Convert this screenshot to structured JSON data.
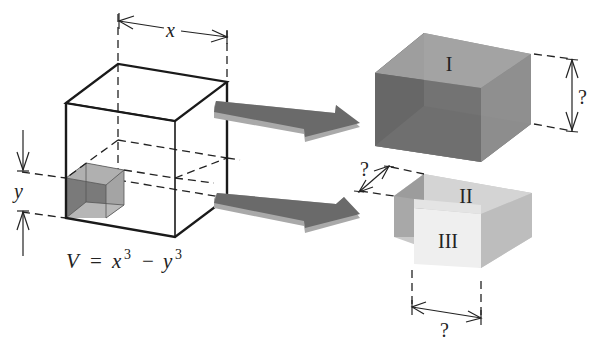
{
  "figure": {
    "left_cube": {
      "dimension_x_label": "x",
      "dimension_y_label": "y",
      "equation": {
        "V": "V",
        "equals": "=",
        "x": "x",
        "x_exp": "3",
        "minus": "−",
        "y": "y",
        "y_exp": "3"
      }
    },
    "pieces": [
      {
        "id": "I",
        "label": "I",
        "dimension_label": "?"
      },
      {
        "id": "II",
        "label": "II",
        "dimension_label": "?"
      },
      {
        "id": "III",
        "label": "III",
        "dimension_label": "?"
      }
    ],
    "arrows": [
      {
        "name": "upper-arrow",
        "color": "#6e6e6e"
      },
      {
        "name": "lower-arrow",
        "color": "#6e6e6e"
      }
    ],
    "colors": {
      "block_I_front": "#5a5a5a",
      "block_I_top": "#9a9a9a",
      "block_I_side": "#7c7c7c",
      "block_II_top": "#d2d2d2",
      "block_II_side": "#b8b8b8",
      "block_II_left": "#9e9e9e",
      "block_III_front": "#ececec",
      "small_cube": "#8a8a8a",
      "arrow_face": "#6c6c6c",
      "arrow_edge": "#a8a8a8"
    }
  }
}
